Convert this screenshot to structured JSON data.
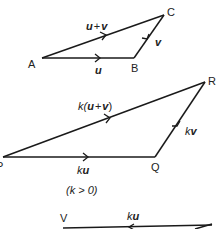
{
  "diagram": {
    "triangle_uv": {
      "points": {
        "A": "A",
        "B": "B",
        "C": "C"
      },
      "edges": {
        "AB": {
          "vec": "u"
        },
        "BC": {
          "vec": "v"
        },
        "AC": {
          "vec": "u",
          "plus": "+",
          "vec2": "v"
        }
      }
    },
    "triangle_k": {
      "points": {
        "P": "P",
        "Q": "Q",
        "R": "R"
      },
      "edges": {
        "PQ": {
          "k": "k",
          "vec": "u"
        },
        "QR": {
          "k": "k",
          "vec": "v"
        },
        "PR": {
          "k": "k(",
          "vec": "u",
          "plus": "+",
          "vec2": "v",
          "close": ")"
        }
      },
      "condition": "(k > 0)"
    },
    "partial_bottom": {
      "point_left": "V",
      "edge_label": {
        "k": "k",
        "vec": "u"
      }
    },
    "colors": {
      "stroke": "#1a1a1a",
      "text": "#222222",
      "background": "#ffffff"
    }
  }
}
